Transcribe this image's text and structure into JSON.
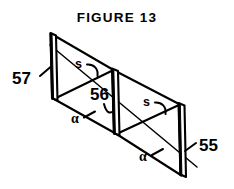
{
  "figure": {
    "title": "FIGURE 13",
    "type": "patent-line-drawing",
    "background_color": "#ffffff",
    "ink_color": "#000000"
  },
  "reference_numerals": [
    {
      "id": "ref-57",
      "text": "57",
      "target": "left-plate"
    },
    {
      "id": "ref-56",
      "text": "56",
      "target": "middle-plate"
    },
    {
      "id": "ref-55",
      "text": "55",
      "target": "right-plate"
    }
  ],
  "symbol_labels": [
    {
      "id": "spacing-1",
      "text": "s",
      "meaning": "spacing-dimension"
    },
    {
      "id": "spacing-2",
      "text": "s",
      "meaning": "spacing-dimension"
    },
    {
      "id": "angle-1",
      "text": "α",
      "meaning": "inclination-angle"
    },
    {
      "id": "angle-2",
      "text": "α",
      "meaning": "inclination-angle"
    }
  ],
  "elements": {
    "plates": [
      {
        "name": "left-plate",
        "numeral": "57"
      },
      {
        "name": "middle-plate",
        "numeral": "56"
      },
      {
        "name": "right-plate",
        "numeral": "55"
      }
    ],
    "axis_line_name": "diagonal-axis-line",
    "zigzag_name": "sawtooth-connector"
  }
}
